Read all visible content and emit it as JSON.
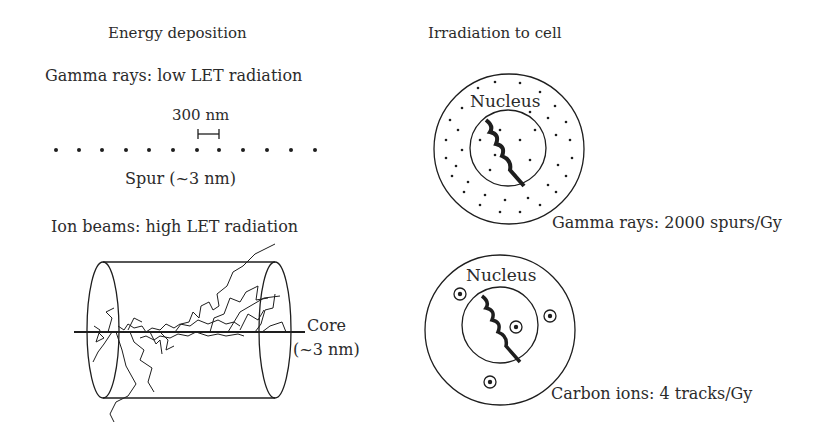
{
  "left_panel": {
    "title": "Energy deposition",
    "gamma": {
      "heading": "Gamma rays: low LET radiation",
      "scale_label": "300 nm",
      "spur_label": "Spur (~3 nm)",
      "spur_count": 13
    },
    "ion": {
      "heading": "Ion beams: high LET radiation",
      "core_label": "Core",
      "core_size": "(~3 nm)"
    }
  },
  "right_panel": {
    "title": "Irradiation to cell",
    "gamma_cell": {
      "nucleus_label": "Nucleus",
      "caption": "Gamma rays: 2000 spurs/Gy"
    },
    "carbon_cell": {
      "nucleus_label": "Nucleus",
      "caption": "Carbon ions: 4 tracks/Gy",
      "track_count": 4
    }
  },
  "colors": {
    "ink": "#1e1e1e",
    "text": "#2b2b2b",
    "background": "#ffffff"
  }
}
